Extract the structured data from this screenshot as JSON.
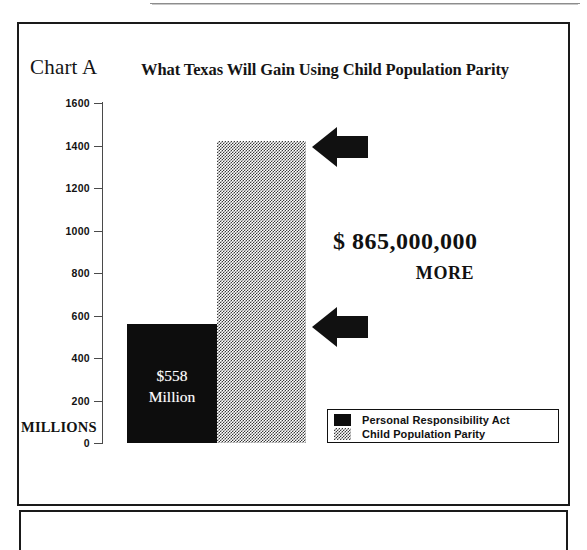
{
  "chart_label": "Chart A",
  "title": "What Texas Will Gain Using Child Population Parity",
  "axis": {
    "unit_label": "MILLIONS",
    "ticks": [
      "1600",
      "1400",
      "1200",
      "1000",
      "800",
      "600",
      "400",
      "200",
      "0"
    ]
  },
  "bars": {
    "pra_value_line1": "$558",
    "pra_value_line2": "Million"
  },
  "annotation": {
    "amount": "$ 865,000,000",
    "word": "MORE"
  },
  "legend": {
    "items": [
      {
        "label": "Personal Responsibility Act",
        "swatch": "solid-black"
      },
      {
        "label": "Child Population Parity",
        "swatch": "dotted-gray"
      }
    ]
  },
  "chart_data": {
    "type": "bar",
    "title": "What Texas Will Gain Using Child Population Parity",
    "xlabel": "",
    "ylabel": "MILLIONS",
    "ylim": [
      0,
      1600
    ],
    "yticks": [
      0,
      200,
      400,
      600,
      800,
      1000,
      1200,
      1400,
      1600
    ],
    "grid": false,
    "legend_position": "bottom-right",
    "categories": [
      "Personal Responsibility Act",
      "Child Population Parity"
    ],
    "values": [
      558,
      1423
    ],
    "value_unit": "millions of dollars",
    "data_labels": [
      "$558 Million",
      ""
    ],
    "annotations": [
      {
        "text": "$ 865,000,000 MORE",
        "refers_to": "difference between Child Population Parity and Personal Responsibility Act"
      }
    ]
  }
}
